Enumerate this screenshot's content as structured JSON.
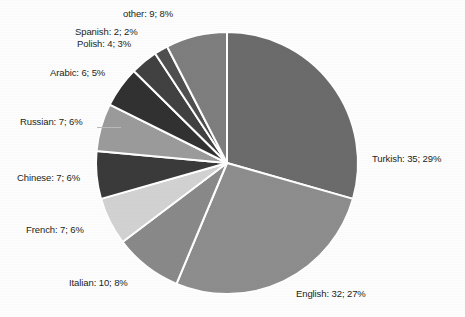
{
  "chart_data": {
    "type": "pie",
    "title": "",
    "subtitle": "",
    "xlabel": "",
    "ylabel": "",
    "legend_position": "none",
    "grid": false,
    "total": 120,
    "label_format": "name: count; percent",
    "start_angle_deg": 0,
    "direction": "clockwise",
    "categories": [
      "Turkish",
      "English",
      "Italian",
      "French",
      "Chinese",
      "Russian",
      "Arabic",
      "Polish",
      "Spanish",
      "other"
    ],
    "values": [
      35,
      32,
      10,
      7,
      7,
      7,
      6,
      4,
      2,
      9
    ],
    "percents": [
      29,
      27,
      8,
      6,
      6,
      6,
      5,
      3,
      2,
      8
    ],
    "colors": [
      "#6b6b6b",
      "#8d8d8d",
      "#898989",
      "#d2d2d2",
      "#3a3a3a",
      "#9b9b9b",
      "#313131",
      "#414141",
      "#4f4f4f",
      "#7e7e7e"
    ],
    "slices": [
      {
        "name": "Turkish",
        "value": 35,
        "percent": 29,
        "label": "Turkish: 35; 29%",
        "color": "#6b6b6b"
      },
      {
        "name": "English",
        "value": 32,
        "percent": 27,
        "label": "English: 32; 27%",
        "color": "#8d8d8d"
      },
      {
        "name": "Italian",
        "value": 10,
        "percent": 8,
        "label": "Italian: 10; 8%",
        "color": "#898989"
      },
      {
        "name": "French",
        "value": 7,
        "percent": 6,
        "label": "French: 7; 6%",
        "color": "#d2d2d2"
      },
      {
        "name": "Chinese",
        "value": 7,
        "percent": 6,
        "label": "Chinese: 7; 6%",
        "color": "#3a3a3a"
      },
      {
        "name": "Russian",
        "value": 7,
        "percent": 6,
        "label": "Russian: 7; 6%",
        "color": "#9b9b9b"
      },
      {
        "name": "Arabic",
        "value": 6,
        "percent": 5,
        "label": "Arabic: 6; 5%",
        "color": "#313131"
      },
      {
        "name": "Polish",
        "value": 4,
        "percent": 3,
        "label": "Polish: 4; 3%",
        "color": "#414141"
      },
      {
        "name": "Spanish",
        "value": 2,
        "percent": 2,
        "label": "Spanish: 2; 2%",
        "color": "#4f4f4f"
      },
      {
        "name": "other",
        "value": 9,
        "percent": 8,
        "label": "other: 9; 8%",
        "color": "#7e7e7e"
      }
    ]
  },
  "geometry": {
    "center_x": 227,
    "center_y": 163,
    "radius": 131,
    "separator_color": "#ffffff",
    "separator_width": 2
  },
  "labels": {
    "turkish": "Turkish: 35; 29%",
    "english": "English: 32; 27%",
    "italian": "Italian: 10; 8%",
    "french": "French: 7; 6%",
    "chinese": "Chinese: 7; 6%",
    "russian": "Russian: 7; 6%",
    "arabic": "Arabic: 6; 5%",
    "polish": "Polish: 4; 3%",
    "spanish": "Spanish: 2; 2%",
    "other": "other: 9; 8%"
  },
  "background_color": "#fdfdfd",
  "text_color": "#231f20"
}
